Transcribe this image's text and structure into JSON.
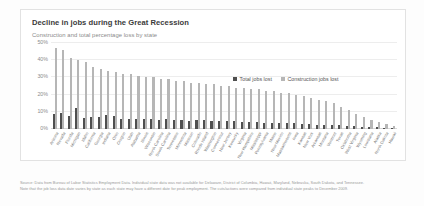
{
  "card": {
    "title": "Decline in jobs during the Great Recession",
    "subtitle": "Construction and total percentage loss by state"
  },
  "legend": {
    "position": "inside-top-right",
    "entries": [
      {
        "label": "Total jobs lost",
        "color": "#4f4f4f",
        "icon": "square-swatch-icon"
      },
      {
        "label": "Construction jobs lost",
        "color": "#b6b6b6",
        "icon": "square-swatch-icon"
      }
    ]
  },
  "notes": [
    "Source: Data from Bureau of Labor Statistics Employment Data. Individual state data was not available for Delaware, District of Columbia, Hawaii, Maryland, Nebraska, South Dakota, and Tennessee.",
    "Note that the job loss data date varies by state as each state may have a different date for peak employment. The cuts/actions were compared from individual state peaks to December 2009."
  ],
  "chart_data": {
    "type": "bar",
    "title": "Decline in jobs during the Great Recession",
    "subtitle": "Construction and total percentage loss by state",
    "xlabel": "",
    "ylabel": "",
    "ylim": [
      0,
      0.5
    ],
    "yticks": [
      0,
      0.1,
      0.2,
      0.3,
      0.4,
      0.5
    ],
    "ytick_labels": [
      "0%",
      "10%",
      "20%",
      "30%",
      "40%",
      "50%"
    ],
    "grid": true,
    "categories": [
      "Arizona",
      "Nevada",
      "Florida",
      "Michigan",
      "Idaho",
      "California",
      "Georgia",
      "Indiana",
      "Ohio",
      "Oregon",
      "Utah",
      "Alabama",
      "Illinois",
      "Wisconsin",
      "North Carolina",
      "South Carolina",
      "Tennessee",
      "Minnesota",
      "Missouri",
      "Colorado",
      "Rhode Island",
      "Washington",
      "Connecticut",
      "New Jersey",
      "Kentucky",
      "Virginia",
      "New Hampshire",
      "Mississippi",
      "Pennsylvania",
      "Maine",
      "New Mexico",
      "Massachusetts",
      "Iowa",
      "Kansas",
      "New York",
      "Arkansas",
      "Montana",
      "Vermont",
      "Texas",
      "Oklahoma",
      "West Virginia",
      "Wyoming",
      "Louisiana",
      "Alaska",
      "North Dakota",
      "Hawaii"
    ],
    "series": [
      {
        "name": "Construction jobs lost",
        "color": "#b6b6b6",
        "values": [
          0.47,
          0.46,
          0.41,
          0.4,
          0.39,
          0.36,
          0.35,
          0.34,
          0.33,
          0.32,
          0.32,
          0.31,
          0.3,
          0.3,
          0.29,
          0.29,
          0.28,
          0.28,
          0.27,
          0.27,
          0.26,
          0.26,
          0.25,
          0.25,
          0.24,
          0.24,
          0.23,
          0.23,
          0.22,
          0.22,
          0.21,
          0.21,
          0.2,
          0.19,
          0.18,
          0.17,
          0.16,
          0.15,
          0.13,
          0.11,
          0.09,
          0.07,
          0.05,
          0.04,
          0.03,
          0.02
        ]
      },
      {
        "name": "Total jobs lost",
        "color": "#4f4f4f",
        "values": [
          0.085,
          0.095,
          0.075,
          0.125,
          0.065,
          0.07,
          0.07,
          0.08,
          0.075,
          0.06,
          0.06,
          0.06,
          0.06,
          0.06,
          0.055,
          0.06,
          0.055,
          0.05,
          0.045,
          0.05,
          0.05,
          0.045,
          0.045,
          0.045,
          0.045,
          0.04,
          0.04,
          0.04,
          0.035,
          0.035,
          0.035,
          0.035,
          0.035,
          0.03,
          0.03,
          0.025,
          0.025,
          0.025,
          0.025,
          0.02,
          0.015,
          0.01,
          0.01,
          0.01,
          0.005,
          0.005
        ]
      }
    ]
  }
}
